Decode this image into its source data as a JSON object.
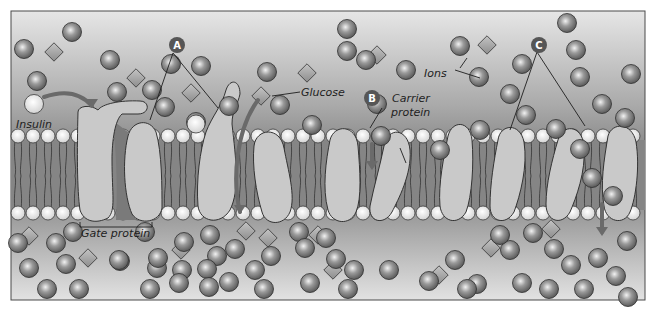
{
  "diagram": {
    "colors": {
      "frame": "#4a4a4a",
      "bg_top": "#e4e4e4",
      "bg_mid": "#8e8e8e",
      "bilayer_core": "#808080",
      "protein": "#c9c9c9",
      "protein_stroke": "#333333",
      "ion": "#7c7c7c",
      "glucose": "#a4a4a4",
      "head": "#ededed",
      "arrow": "#6a6a6a",
      "badge": "#565656"
    },
    "badges": [
      {
        "id": "A",
        "label": "A"
      },
      {
        "id": "B",
        "label": "B"
      },
      {
        "id": "C",
        "label": "C"
      }
    ],
    "labels": {
      "insulin": "Insulin",
      "glucose": "Glucose",
      "ions": "Ions",
      "carrier_line1": "Carrier",
      "carrier_line2": "protein",
      "gate": "Gate protein"
    },
    "ions": [
      [
        72,
        32
      ],
      [
        347,
        29
      ],
      [
        567,
        23
      ],
      [
        24,
        49
      ],
      [
        110,
        60
      ],
      [
        171,
        64
      ],
      [
        201,
        66
      ],
      [
        267,
        72
      ],
      [
        347,
        51
      ],
      [
        460,
        46
      ],
      [
        576,
        50
      ],
      [
        522,
        64
      ],
      [
        37,
        81
      ],
      [
        117,
        92
      ],
      [
        152,
        90
      ],
      [
        229,
        106
      ],
      [
        280,
        105
      ],
      [
        366,
        60
      ],
      [
        406,
        70
      ],
      [
        479,
        77
      ],
      [
        580,
        77
      ],
      [
        602,
        104
      ],
      [
        510,
        94
      ],
      [
        631,
        74
      ],
      [
        625,
        118
      ],
      [
        526,
        115
      ],
      [
        480,
        130
      ],
      [
        165,
        107
      ],
      [
        312,
        125
      ],
      [
        556,
        129
      ],
      [
        377,
        104
      ],
      [
        196,
        122
      ],
      [
        580,
        149
      ],
      [
        381,
        136
      ],
      [
        440,
        150
      ],
      [
        592,
        178
      ],
      [
        613,
        196
      ],
      [
        73,
        232
      ],
      [
        18,
        243
      ],
      [
        56,
        243
      ],
      [
        29,
        268
      ],
      [
        66,
        264
      ],
      [
        120,
        261
      ],
      [
        47,
        289
      ],
      [
        79,
        289
      ],
      [
        184,
        242
      ],
      [
        210,
        235
      ],
      [
        235,
        249
      ],
      [
        217,
        256
      ],
      [
        145,
        232
      ],
      [
        119,
        260
      ],
      [
        157,
        268
      ],
      [
        150,
        289
      ],
      [
        158,
        258
      ],
      [
        182,
        270
      ],
      [
        207,
        269
      ],
      [
        229,
        282
      ],
      [
        179,
        283
      ],
      [
        209,
        287
      ],
      [
        255,
        270
      ],
      [
        264,
        289
      ],
      [
        299,
        232
      ],
      [
        305,
        248
      ],
      [
        326,
        238
      ],
      [
        336,
        259
      ],
      [
        271,
        256
      ],
      [
        310,
        283
      ],
      [
        354,
        270
      ],
      [
        348,
        289
      ],
      [
        389,
        270
      ],
      [
        455,
        260
      ],
      [
        477,
        284
      ],
      [
        510,
        250
      ],
      [
        554,
        249
      ],
      [
        500,
        235
      ],
      [
        533,
        233
      ],
      [
        598,
        258
      ],
      [
        627,
        241
      ],
      [
        616,
        276
      ],
      [
        571,
        265
      ],
      [
        584,
        289
      ],
      [
        628,
        297
      ],
      [
        429,
        281
      ],
      [
        522,
        283
      ],
      [
        549,
        289
      ],
      [
        467,
        289
      ]
    ],
    "glucose": [
      [
        54,
        52
      ],
      [
        136,
        78
      ],
      [
        191,
        93
      ],
      [
        307,
        73
      ],
      [
        261,
        96
      ],
      [
        377,
        55
      ],
      [
        487,
        45
      ],
      [
        29,
        236
      ],
      [
        88,
        258
      ],
      [
        181,
        250
      ],
      [
        246,
        231
      ],
      [
        268,
        238
      ],
      [
        318,
        235
      ],
      [
        333,
        270
      ],
      [
        491,
        248
      ],
      [
        439,
        275
      ],
      [
        551,
        229
      ]
    ],
    "proteins": [
      {
        "name": "gate-protein-left",
        "path": "M78,112 C78,106 90,104 98,110 C102,104 120,100 140,101 C150,101 150,114 138,114 L122,114 C115,120 112,140 112,160 C112,195 116,210 108,218 C96,224 84,222 80,210 C77,190 77,150 78,112 Z"
      },
      {
        "name": "gate-protein-right",
        "path": "M128,136 C132,120 150,118 156,132 C162,152 162,188 162,208 C160,222 140,226 132,214 C124,196 122,160 128,136 Z"
      },
      {
        "name": "channel-protein-tall",
        "path": "M226,90 C230,78 240,80 240,94 C238,104 232,110 232,124 C236,160 240,190 230,210 C220,226 200,222 198,206 C196,180 200,150 206,132 C212,116 222,106 226,90 Z"
      },
      {
        "name": "carrier-1",
        "path": "M254,146 C256,128 280,126 284,148 C288,170 296,196 290,212 C284,226 266,226 262,212 C256,192 252,166 254,146 Z"
      },
      {
        "name": "carrier-2",
        "path": "M330,140 C334,124 356,124 358,146 C360,170 362,198 356,212 C350,226 332,224 328,210 C322,188 326,160 330,140 Z"
      },
      {
        "name": "carrier-3",
        "path": "M384,146 C388,126 408,128 410,150 C412,174 398,200 392,212 C384,226 368,222 370,206 C374,186 380,166 384,146 Z"
      },
      {
        "name": "carrier-4",
        "path": "M448,136 C452,120 470,120 472,140 C474,164 472,196 466,212 C458,226 442,222 440,206 C438,184 444,156 448,136 Z"
      },
      {
        "name": "carrier-5",
        "path": "M498,140 C500,124 520,122 524,142 C528,166 520,196 514,212 C506,226 490,222 490,206 C490,184 494,160 498,140 Z"
      },
      {
        "name": "carrier-6",
        "path": "M558,140 C562,124 582,124 584,146 C586,172 576,198 570,212 C562,226 546,222 546,204 C546,184 552,160 558,140 Z"
      },
      {
        "name": "carrier-7",
        "path": "M608,136 C612,122 632,122 636,142 C640,166 636,198 630,212 C624,226 606,222 604,206 C600,184 604,160 608,136 Z"
      }
    ],
    "annotation_lines": [
      [
        173,
        53,
        150,
        120
      ],
      [
        173,
        53,
        218,
        108
      ],
      [
        382,
        108,
        370,
        128
      ],
      [
        467,
        58,
        460,
        68
      ],
      [
        455,
        70,
        480,
        78
      ],
      [
        406,
        163,
        400,
        148
      ],
      [
        537,
        52,
        510,
        130
      ],
      [
        537,
        52,
        585,
        126
      ],
      [
        300,
        92,
        272,
        96
      ]
    ],
    "arrows": [
      {
        "name": "insulin-arrow",
        "path": "M44,97 C64,90 80,92 92,106",
        "head": [
          92,
          106
        ]
      },
      {
        "name": "glucose-arrow",
        "path": "M258,100 C236,130 232,180 240,212",
        "head": [
          240,
          212
        ]
      },
      {
        "name": "ion-arrow-b",
        "path": "M372,144 L372,166",
        "head": [
          372,
          168
        ]
      },
      {
        "name": "ion-arrow-c",
        "path": "M602,204 L602,232",
        "head": [
          602,
          234
        ]
      }
    ]
  }
}
